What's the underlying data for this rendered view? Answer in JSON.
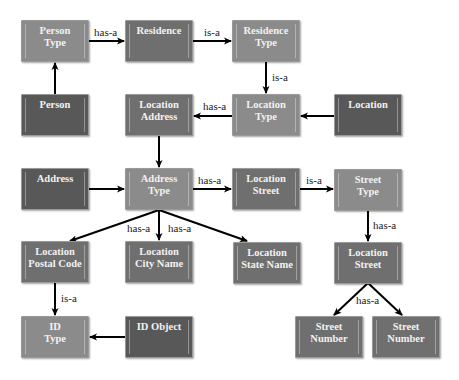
{
  "diagram": {
    "colors": {
      "light": "#8b8b8b",
      "medium": "#6f6f6f",
      "dark": "#585858",
      "edge": "#000000"
    },
    "nodes": [
      {
        "id": "person_type",
        "label": "Person\nType",
        "shade": "light"
      },
      {
        "id": "residence",
        "label": "Residence",
        "shade": "medium"
      },
      {
        "id": "residence_type",
        "label": "Residence\nType",
        "shade": "light"
      },
      {
        "id": "person",
        "label": "Person",
        "shade": "dark"
      },
      {
        "id": "location_address",
        "label": "Location\nAddress",
        "shade": "medium"
      },
      {
        "id": "location_type",
        "label": "Location\nType",
        "shade": "light"
      },
      {
        "id": "location",
        "label": "Location",
        "shade": "dark"
      },
      {
        "id": "address",
        "label": "Address",
        "shade": "dark"
      },
      {
        "id": "address_type",
        "label": "Address\nType",
        "shade": "light"
      },
      {
        "id": "location_street_1",
        "label": "Location\nStreet",
        "shade": "medium"
      },
      {
        "id": "street_type",
        "label": "Street\nType",
        "shade": "light"
      },
      {
        "id": "location_postal_code",
        "label": "Location\nPostal Code",
        "shade": "medium"
      },
      {
        "id": "location_city_name",
        "label": "Location\nCity Name",
        "shade": "medium"
      },
      {
        "id": "location_state_name",
        "label": "Location\nState Name",
        "shade": "medium"
      },
      {
        "id": "location_street_2",
        "label": "Location\nStreet",
        "shade": "medium"
      },
      {
        "id": "id_type",
        "label": "ID\nType",
        "shade": "light"
      },
      {
        "id": "id_object",
        "label": "ID Object",
        "shade": "dark"
      },
      {
        "id": "street_number_1",
        "label": "Street\nNumber",
        "shade": "medium"
      },
      {
        "id": "street_number_2",
        "label": "Street\nNumber",
        "shade": "medium"
      }
    ],
    "edges": [
      {
        "from": "person_type",
        "to": "residence",
        "label": "has-a"
      },
      {
        "from": "residence",
        "to": "residence_type",
        "label": "is-a"
      },
      {
        "from": "person",
        "to": "person_type",
        "label": ""
      },
      {
        "from": "residence_type",
        "to": "location_type",
        "label": "is-a"
      },
      {
        "from": "location_type",
        "to": "location_address",
        "label": "has-a"
      },
      {
        "from": "location",
        "to": "location_type",
        "label": ""
      },
      {
        "from": "location_address",
        "to": "address_type",
        "label": ""
      },
      {
        "from": "address",
        "to": "address_type",
        "label": ""
      },
      {
        "from": "address_type",
        "to": "location_street_1",
        "label": "has-a"
      },
      {
        "from": "location_street_1",
        "to": "street_type",
        "label": "is-a"
      },
      {
        "from": "address_type",
        "to": "location_postal_code",
        "label": ""
      },
      {
        "from": "address_type",
        "to": "location_city_name",
        "label": "has-a"
      },
      {
        "from": "address_type",
        "to": "location_state_name",
        "label": "has-a"
      },
      {
        "from": "street_type",
        "to": "location_street_2",
        "label": "has-a"
      },
      {
        "from": "location_postal_code",
        "to": "id_type",
        "label": "is-a"
      },
      {
        "from": "id_object",
        "to": "id_type",
        "label": ""
      },
      {
        "from": "location_street_2",
        "to": "street_number_1",
        "label": "has-a"
      },
      {
        "from": "location_street_2",
        "to": "street_number_2",
        "label": ""
      }
    ],
    "edge_labels": {
      "person_type_residence": "has-a",
      "residence_residence_type": "is-a",
      "residence_type_location_type": "is-a",
      "location_type_location_address": "has-a",
      "address_type_location_street": "has-a",
      "location_street_street_type": "is-a",
      "address_type_city_left": "has-a",
      "address_type_city_right": "has-a",
      "street_type_location_street": "has-a",
      "postal_code_id_type": "is-a",
      "location_street_street_numbers": "has-a"
    }
  }
}
